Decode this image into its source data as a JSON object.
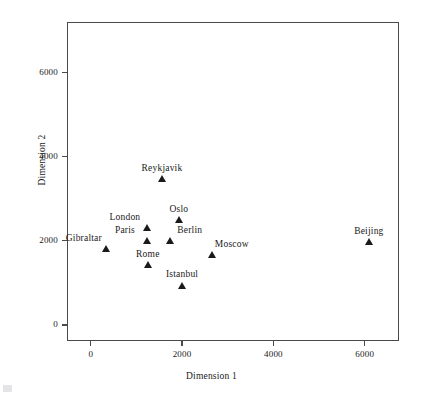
{
  "chart_data": {
    "type": "scatter",
    "title": "",
    "xlabel": "Dimension 1",
    "ylabel": "Dimension 2",
    "xlim": [
      -520,
      6750
    ],
    "ylim": [
      -380,
      7200
    ],
    "xticks": [
      0,
      2000,
      4000,
      6000
    ],
    "yticks": [
      0,
      2000,
      4000,
      6000
    ],
    "xticklabels": [
      "0",
      "2000",
      "4000",
      "6000"
    ],
    "yticklabels": [
      "0",
      "2000",
      "4000",
      "6000"
    ],
    "grid": false,
    "legend": false,
    "marker": "triangle-filled",
    "marker_color": "#1a1a1a",
    "points": [
      {
        "label": "Gibraltar",
        "x": 330,
        "y": 1810,
        "label_pos": "left"
      },
      {
        "label": "Paris",
        "x": 1230,
        "y": 2000,
        "label_pos": "left"
      },
      {
        "label": "London",
        "x": 1230,
        "y": 2310,
        "label_pos": "left"
      },
      {
        "label": "Rome",
        "x": 1250,
        "y": 1430,
        "label_pos": "center"
      },
      {
        "label": "Reykjavik",
        "x": 1560,
        "y": 3480,
        "label_pos": "center"
      },
      {
        "label": "Berlin",
        "x": 1730,
        "y": 2000,
        "label_pos": "right"
      },
      {
        "label": "Oslo",
        "x": 1930,
        "y": 2500,
        "label_pos": "center"
      },
      {
        "label": "Istanbul",
        "x": 2000,
        "y": 950,
        "label_pos": "center"
      },
      {
        "label": "Moscow",
        "x": 2650,
        "y": 1670,
        "label_pos": "right"
      },
      {
        "label": "Beijing",
        "x": 6090,
        "y": 1980,
        "label_pos": "center"
      }
    ]
  },
  "artifacts": {
    "top_left_smudge": "",
    "top_right_smudge": "",
    "mid_smudge": ""
  }
}
